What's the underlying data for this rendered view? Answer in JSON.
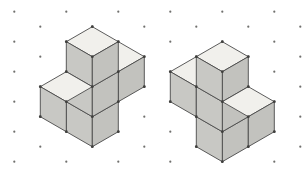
{
  "scene": {
    "description": "Two isometric cube-block figures (mirror images) drawn on isometric dot paper",
    "canvas": {
      "width": 308,
      "height": 176,
      "background": "#ffffff"
    },
    "lattice": {
      "x0": 14.3,
      "col_spacing": 26,
      "cols": 12,
      "even_col_ys": [
        11.7,
        41.7,
        71.7,
        101.7,
        131.7,
        161.7
      ],
      "odd_col_ys": [
        26.7,
        56.7,
        86.7,
        116.7,
        146.7
      ],
      "dot_color": "#70706e",
      "dot_radius": 1.1
    },
    "palette": {
      "top_face": "#f1f0ec",
      "left_face": "#c8c8c4",
      "right_face": "#c2c2be",
      "edge": "#4a4a4a",
      "edge_width": 0.9,
      "vertex_dot": "#3f3f3d",
      "vertex_radius": 1.4
    },
    "figures": [
      {
        "name": "left-figure",
        "cube_cells": [
          [
            0,
            0,
            0
          ],
          [
            1,
            0,
            0
          ],
          [
            1,
            0,
            1
          ],
          [
            1,
            0,
            2
          ],
          [
            2,
            0,
            2
          ]
        ],
        "cube_count": 5,
        "faces": [
          {
            "shade": "top_face",
            "points": [
              [
                118.3,
                41.7
              ],
              [
                144.3,
                56.7
              ],
              [
                118.3,
                71.7
              ],
              [
                92.3,
                56.7
              ]
            ]
          },
          {
            "shade": "right_face",
            "points": [
              [
                144.3,
                56.7
              ],
              [
                144.3,
                86.7
              ],
              [
                118.3,
                101.7
              ],
              [
                118.3,
                71.7
              ]
            ]
          },
          {
            "shade": "left_face",
            "points": [
              [
                66.3,
                101.7
              ],
              [
                92.3,
                116.7
              ],
              [
                92.3,
                146.7
              ],
              [
                66.3,
                131.7
              ]
            ]
          },
          {
            "shade": "right_face",
            "points": [
              [
                92.3,
                116.7
              ],
              [
                118.3,
                101.7
              ],
              [
                118.3,
                131.7
              ],
              [
                92.3,
                146.7
              ]
            ]
          },
          {
            "shade": "left_face",
            "points": [
              [
                66.3,
                71.7
              ],
              [
                92.3,
                86.7
              ],
              [
                92.3,
                116.7
              ],
              [
                66.3,
                101.7
              ]
            ]
          },
          {
            "shade": "right_face",
            "points": [
              [
                92.3,
                86.7
              ],
              [
                118.3,
                71.7
              ],
              [
                118.3,
                101.7
              ],
              [
                92.3,
                116.7
              ]
            ]
          },
          {
            "shade": "top_face",
            "points": [
              [
                92.3,
                26.7
              ],
              [
                118.3,
                41.7
              ],
              [
                92.3,
                56.7
              ],
              [
                66.3,
                41.7
              ]
            ]
          },
          {
            "shade": "left_face",
            "points": [
              [
                66.3,
                41.7
              ],
              [
                92.3,
                56.7
              ],
              [
                92.3,
                86.7
              ],
              [
                66.3,
                71.7
              ]
            ]
          },
          {
            "shade": "right_face",
            "points": [
              [
                92.3,
                56.7
              ],
              [
                118.3,
                41.7
              ],
              [
                118.3,
                71.7
              ],
              [
                92.3,
                86.7
              ]
            ]
          },
          {
            "shade": "top_face",
            "points": [
              [
                66.3,
                71.7
              ],
              [
                92.3,
                86.7
              ],
              [
                66.3,
                101.7
              ],
              [
                40.3,
                86.7
              ]
            ]
          },
          {
            "shade": "left_face",
            "points": [
              [
                40.3,
                86.7
              ],
              [
                66.3,
                101.7
              ],
              [
                66.3,
                131.7
              ],
              [
                40.3,
                116.7
              ]
            ]
          }
        ],
        "vertices": [
          [
            92.3,
            26.7
          ],
          [
            66.3,
            41.7
          ],
          [
            118.3,
            41.7
          ],
          [
            92.3,
            56.7
          ],
          [
            144.3,
            56.7
          ],
          [
            66.3,
            71.7
          ],
          [
            118.3,
            71.7
          ],
          [
            40.3,
            86.7
          ],
          [
            92.3,
            86.7
          ],
          [
            144.3,
            86.7
          ],
          [
            66.3,
            101.7
          ],
          [
            118.3,
            101.7
          ],
          [
            40.3,
            116.7
          ],
          [
            92.3,
            116.7
          ],
          [
            66.3,
            131.7
          ],
          [
            118.3,
            131.7
          ],
          [
            92.3,
            146.7
          ]
        ]
      },
      {
        "name": "right-figure",
        "cube_cells": [
          [
            0,
            0,
            0
          ],
          [
            0,
            1,
            0
          ],
          [
            0,
            1,
            1
          ],
          [
            0,
            1,
            2
          ],
          [
            0,
            2,
            2
          ]
        ],
        "cube_count": 5,
        "faces": [
          {
            "shade": "top_face",
            "points": [
              [
                196.3,
                56.7
              ],
              [
                170.3,
                71.7
              ],
              [
                196.3,
                86.7
              ],
              [
                222.3,
                71.7
              ]
            ]
          },
          {
            "shade": "left_face",
            "points": [
              [
                170.3,
                71.7
              ],
              [
                170.3,
                101.7
              ],
              [
                196.3,
                116.7
              ],
              [
                196.3,
                86.7
              ]
            ]
          },
          {
            "shade": "right_face",
            "points": [
              [
                248.3,
                116.7
              ],
              [
                222.3,
                131.7
              ],
              [
                222.3,
                161.7
              ],
              [
                248.3,
                146.7
              ]
            ]
          },
          {
            "shade": "left_face",
            "points": [
              [
                222.3,
                131.7
              ],
              [
                196.3,
                116.7
              ],
              [
                196.3,
                146.7
              ],
              [
                222.3,
                161.7
              ]
            ]
          },
          {
            "shade": "right_face",
            "points": [
              [
                248.3,
                86.7
              ],
              [
                222.3,
                101.7
              ],
              [
                222.3,
                131.7
              ],
              [
                248.3,
                116.7
              ]
            ]
          },
          {
            "shade": "left_face",
            "points": [
              [
                222.3,
                101.7
              ],
              [
                196.3,
                86.7
              ],
              [
                196.3,
                116.7
              ],
              [
                222.3,
                131.7
              ]
            ]
          },
          {
            "shade": "top_face",
            "points": [
              [
                222.3,
                41.7
              ],
              [
                196.3,
                56.7
              ],
              [
                222.3,
                71.7
              ],
              [
                248.3,
                56.7
              ]
            ]
          },
          {
            "shade": "right_face",
            "points": [
              [
                248.3,
                56.7
              ],
              [
                222.3,
                71.7
              ],
              [
                222.3,
                101.7
              ],
              [
                248.3,
                86.7
              ]
            ]
          },
          {
            "shade": "left_face",
            "points": [
              [
                222.3,
                71.7
              ],
              [
                196.3,
                56.7
              ],
              [
                196.3,
                86.7
              ],
              [
                222.3,
                101.7
              ]
            ]
          },
          {
            "shade": "top_face",
            "points": [
              [
                248.3,
                86.7
              ],
              [
                222.3,
                101.7
              ],
              [
                248.3,
                116.7
              ],
              [
                274.3,
                101.7
              ]
            ]
          },
          {
            "shade": "right_face",
            "points": [
              [
                274.3,
                101.7
              ],
              [
                248.3,
                116.7
              ],
              [
                248.3,
                146.7
              ],
              [
                274.3,
                131.7
              ]
            ]
          }
        ],
        "vertices": [
          [
            222.3,
            41.7
          ],
          [
            248.3,
            56.7
          ],
          [
            196.3,
            56.7
          ],
          [
            222.3,
            71.7
          ],
          [
            170.3,
            71.7
          ],
          [
            248.3,
            86.7
          ],
          [
            196.3,
            86.7
          ],
          [
            274.3,
            101.7
          ],
          [
            222.3,
            101.7
          ],
          [
            170.3,
            101.7
          ],
          [
            248.3,
            116.7
          ],
          [
            196.3,
            116.7
          ],
          [
            274.3,
            131.7
          ],
          [
            222.3,
            131.7
          ],
          [
            248.3,
            146.7
          ],
          [
            196.3,
            146.7
          ],
          [
            222.3,
            161.7
          ]
        ]
      }
    ]
  }
}
